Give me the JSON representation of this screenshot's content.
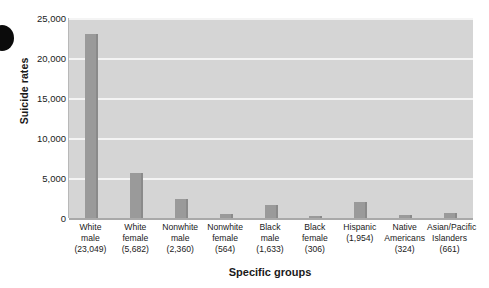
{
  "chart_data": {
    "type": "bar",
    "title": "",
    "xlabel": "Specific groups",
    "ylabel": "Suicide rates",
    "ylim": [
      0,
      25000
    ],
    "grid": true,
    "legend": null,
    "categories": [
      "White male",
      "White female",
      "Nonwhite male",
      "Nonwhite female",
      "Black male",
      "Black female",
      "Hispanic",
      "Native Americans",
      "Asian/Pacific Islanders"
    ],
    "values": [
      23049,
      5682,
      2360,
      564,
      1633,
      306,
      1954,
      324,
      661
    ],
    "ytick_labels": [
      "0",
      "5,000",
      "10,000",
      "15,000",
      "20,000",
      "25,000"
    ],
    "ytick_values": [
      0,
      5000,
      10000,
      15000,
      20000,
      25000
    ],
    "xtick_labels": [
      {
        "line1": "White",
        "line2": "male",
        "line3": "(23,049)"
      },
      {
        "line1": "White",
        "line2": "female",
        "line3": "(5,682)"
      },
      {
        "line1": "Nonwhite",
        "line2": "male",
        "line3": "(2,360)"
      },
      {
        "line1": "Nonwhite",
        "line2": "female",
        "line3": "(564)"
      },
      {
        "line1": "Black",
        "line2": "male",
        "line3": "(1,633)"
      },
      {
        "line1": "Black",
        "line2": "female",
        "line3": "(306)"
      },
      {
        "line1": "Hispanic",
        "line2": "(1,954)",
        "line3": ""
      },
      {
        "line1": "Native",
        "line2": "Americans",
        "line3": "(324)"
      },
      {
        "line1": "Asian/Pacific",
        "line2": "Islanders",
        "line3": "(661)"
      }
    ],
    "colors": {
      "bar": "#9a9a9a",
      "bar_shadow": "#8a8a8a",
      "plot_background": "#d5d5d5",
      "gridline": "#f4f4f4",
      "text": "#1a1a1a",
      "page_background": "#ffffff"
    }
  }
}
